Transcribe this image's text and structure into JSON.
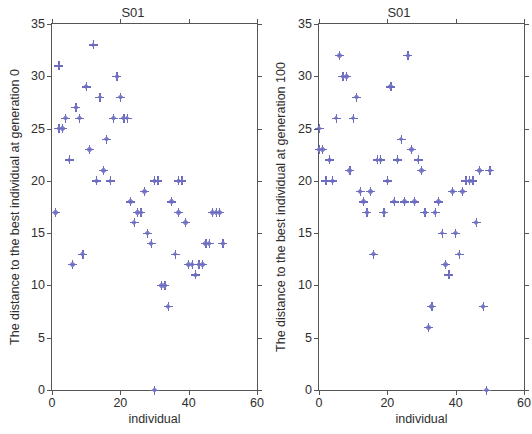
{
  "figure": {
    "background": "#ffffff",
    "marker_color": "#6b6bc0",
    "axis_color": "#555555",
    "marker_symbol": "plus"
  },
  "chart_data": [
    {
      "type": "scatter",
      "title": "S01",
      "xlabel": "individual",
      "ylabel": "The distance to the best individual at generation 0",
      "xlim": [
        0,
        60
      ],
      "ylim": [
        0,
        35
      ],
      "xticks": [
        0,
        20,
        40,
        60
      ],
      "yticks": [
        0,
        5,
        10,
        15,
        20,
        25,
        30,
        35
      ],
      "grid": false,
      "legend": null,
      "marker": "+",
      "color": "#6b6bc0",
      "x": [
        1,
        2,
        2,
        3,
        4,
        5,
        6,
        7,
        8,
        9,
        10,
        11,
        12,
        13,
        14,
        15,
        16,
        17,
        18,
        19,
        20,
        21,
        22,
        23,
        24,
        25,
        26,
        27,
        28,
        29,
        30,
        30,
        31,
        32,
        33,
        34,
        35,
        36,
        37,
        37,
        38,
        39,
        40,
        41,
        42,
        43,
        44,
        45,
        46,
        47,
        48,
        49,
        50
      ],
      "y": [
        17,
        25,
        31,
        25,
        26,
        22,
        12,
        27,
        26,
        13,
        29,
        23,
        33,
        20,
        28,
        21,
        24,
        20,
        26,
        30,
        28,
        26,
        26,
        18,
        16,
        17,
        17,
        19,
        15,
        14,
        0,
        20,
        20,
        10,
        10,
        8,
        18,
        13,
        17,
        20,
        20,
        16,
        12,
        12,
        11,
        12,
        12,
        14,
        14,
        17,
        17,
        17,
        14
      ]
    },
    {
      "type": "scatter",
      "title": "S01",
      "xlabel": "individual",
      "ylabel": "The distance to the best individual at generation 100",
      "xlim": [
        0,
        60
      ],
      "ylim": [
        0,
        35
      ],
      "xticks": [
        0,
        20,
        40,
        60
      ],
      "yticks": [
        0,
        5,
        10,
        15,
        20,
        25,
        30,
        35
      ],
      "grid": false,
      "legend": null,
      "marker": "+",
      "color": "#6b6bc0",
      "x": [
        0,
        0,
        1,
        2,
        3,
        4,
        5,
        6,
        7,
        8,
        9,
        10,
        11,
        12,
        13,
        14,
        15,
        16,
        17,
        18,
        19,
        20,
        21,
        22,
        23,
        24,
        25,
        26,
        27,
        28,
        29,
        30,
        31,
        31,
        32,
        33,
        34,
        35,
        36,
        37,
        38,
        39,
        40,
        41,
        42,
        43,
        44,
        45,
        46,
        47,
        48,
        49,
        50
      ],
      "y": [
        25,
        23,
        23,
        20,
        22,
        20,
        26,
        32,
        30,
        30,
        21,
        26,
        28,
        19,
        18,
        17,
        19,
        13,
        22,
        22,
        17,
        20,
        29,
        18,
        22,
        24,
        18,
        32,
        23,
        18,
        22,
        21,
        17,
        17,
        6,
        8,
        17,
        18,
        15,
        12,
        11,
        19,
        15,
        13,
        19,
        20,
        20,
        20,
        16,
        21,
        8,
        0,
        21
      ]
    }
  ],
  "panels": [
    {
      "title": "S01",
      "ylabel": "The distance to the best individual at generation 0",
      "xlabel": "individual",
      "ytick_labels": [
        "0",
        "5",
        "10",
        "15",
        "20",
        "25",
        "30",
        "35"
      ],
      "xtick_labels": [
        "0",
        "20",
        "40",
        "60"
      ]
    },
    {
      "title": "S01",
      "ylabel": "The distance to the best individual at generation 100",
      "xlabel": "individual",
      "ytick_labels": [
        "0",
        "5",
        "10",
        "15",
        "20",
        "25",
        "30",
        "35"
      ],
      "xtick_labels": [
        "0",
        "20",
        "40",
        "60"
      ]
    }
  ]
}
